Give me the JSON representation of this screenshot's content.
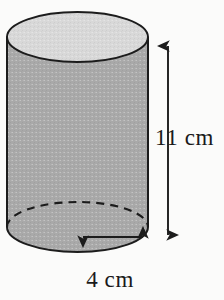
{
  "figure": {
    "kind": "geometry-diagram",
    "shape": "cylinder",
    "alt": "Shaded right circular cylinder with height 11 cm and radius 4 cm",
    "colors": {
      "background": "#fbfbfa",
      "body_fill": "#a9a9a9",
      "top_fill": "#d8d8d8",
      "outline": "#1c1c1c",
      "text": "#1a1a1a"
    },
    "labels": {
      "height": "11 cm",
      "radius": "4 cm"
    },
    "measurements": [
      {
        "name": "height",
        "value": 11,
        "unit": "cm",
        "text": "11 cm",
        "orientation": "vertical",
        "arrow": "double-headed"
      },
      {
        "name": "radius",
        "value": 4,
        "unit": "cm",
        "text": "4 cm",
        "orientation": "horizontal",
        "arrow": "double-headed"
      }
    ],
    "geometry": {
      "center_x": 77.5,
      "radius_x": 70.5,
      "top_center_y": 37,
      "top_radius_y": 25,
      "bottom_center_y": 227,
      "bottom_radius_y": 25,
      "height_arrow_x": 168,
      "height_arrow_top_y": 41,
      "height_arrow_bottom_y": 240,
      "radius_arrow_y": 237,
      "radius_arrow_x1": 78,
      "radius_arrow_x2": 148
    }
  }
}
